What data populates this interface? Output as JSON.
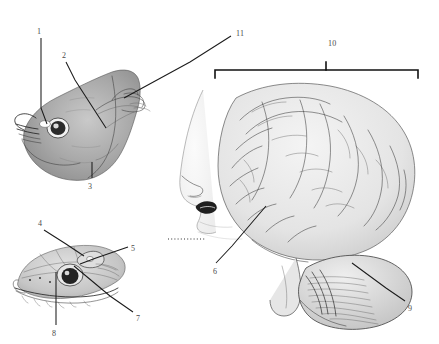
{
  "figure": {
    "background_color": "#ffffff",
    "ink_color": "#3a3a3a",
    "label_color": "#4a4a4a",
    "width": 439,
    "height": 344
  },
  "panels": [
    {
      "name": "fish-head",
      "subject": "fish head lateral view with exposed pineal organ",
      "bbox": [
        18,
        60,
        150,
        130
      ]
    },
    {
      "name": "lizard-head",
      "subject": "lizard head lateral view with parietal eye",
      "bbox": [
        15,
        235,
        145,
        85
      ]
    },
    {
      "name": "human-head-brain",
      "subject": "human head profile with sagittal brain and cerebellum",
      "bbox": [
        180,
        80,
        250,
        250
      ]
    }
  ],
  "labels": [
    {
      "id": "1",
      "text": "1",
      "x": 37,
      "y": 28
    },
    {
      "id": "2",
      "text": "2",
      "x": 62,
      "y": 52
    },
    {
      "id": "3",
      "text": "3",
      "x": 88,
      "y": 183
    },
    {
      "id": "4",
      "text": "4",
      "x": 38,
      "y": 220
    },
    {
      "id": "5",
      "text": "5",
      "x": 131,
      "y": 245
    },
    {
      "id": "6",
      "text": "6",
      "x": 213,
      "y": 268
    },
    {
      "id": "7",
      "text": "7",
      "x": 136,
      "y": 315
    },
    {
      "id": "8",
      "text": "8",
      "x": 52,
      "y": 330
    },
    {
      "id": "9",
      "text": "9",
      "x": 408,
      "y": 305
    },
    {
      "id": "10",
      "text": "10",
      "x": 328,
      "y": 40
    },
    {
      "id": "11",
      "text": "11",
      "x": 236,
      "y": 30
    }
  ],
  "bracket": {
    "name": "brain-span-bracket",
    "label_ref": "10",
    "x_start": 215,
    "x_end": 418,
    "y": 70,
    "tick_x": 326
  },
  "leaders": [
    {
      "from_label": "1",
      "points": "41,38 41,108 47,124"
    },
    {
      "from_label": "2",
      "points": "66,62 75,80 106,128"
    },
    {
      "from_label": "3",
      "points": "92,178 92,160"
    },
    {
      "from_label": "4",
      "points": "44,230 66,244 84,256"
    },
    {
      "from_label": "5",
      "points": "128,247 96,258 80,264"
    },
    {
      "from_label": "6",
      "points": "216,263 232,246 266,206"
    },
    {
      "from_label": "7",
      "points": "133,312 110,296 74,266"
    },
    {
      "from_label": "8",
      "points": "56,325 56,296 56,272"
    },
    {
      "from_label": "9",
      "points": "405,301 386,288 352,263"
    },
    {
      "from_label": "11",
      "points": "231,36 190,62 124,98"
    }
  ],
  "dotted_marks": {
    "name": "teeth-dotted-line",
    "x_start": 168,
    "x_end": 206,
    "y": 239
  }
}
